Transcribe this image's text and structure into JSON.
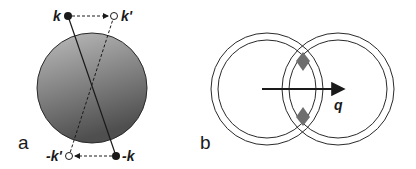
{
  "panels": {
    "a": {
      "label": "a",
      "points": {
        "k": "k",
        "k_prime": "k'",
        "neg_k": "-k",
        "neg_k_prime": "-k'"
      }
    },
    "b": {
      "label": "b",
      "vector": "q"
    }
  },
  "colors": {
    "ink": "#1a1a1a",
    "sphere_light": "#b8b8b8",
    "sphere_dark": "#5a5a5a",
    "diamond": "#6e6e6e"
  }
}
